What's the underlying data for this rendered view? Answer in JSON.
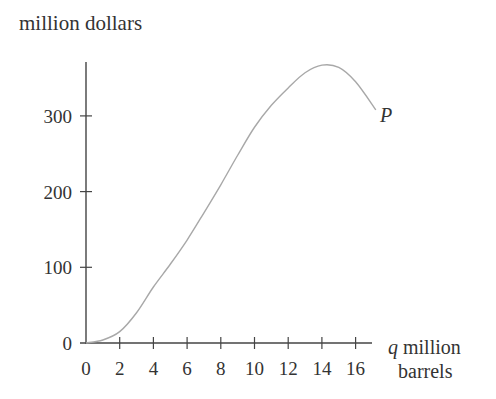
{
  "chart_data": {
    "type": "line",
    "title": "",
    "ylabel": "million dollars",
    "xlabel_var": "q",
    "xlabel": "million barrels",
    "curve_label": "P",
    "xlim": [
      0,
      17.5
    ],
    "ylim": [
      0,
      370
    ],
    "x_ticks": [
      0,
      2,
      4,
      6,
      8,
      10,
      12,
      14,
      16
    ],
    "y_ticks": [
      0,
      100,
      200,
      300
    ],
    "grid": false,
    "legend": null,
    "series": [
      {
        "name": "P",
        "color": "#a8a8a8",
        "x": [
          0,
          1,
          2,
          3,
          4,
          5,
          6,
          7,
          8,
          9,
          10,
          11,
          12,
          13,
          14,
          15,
          16,
          17.2
        ],
        "values": [
          0,
          4,
          15,
          40,
          74,
          104,
          136,
          172,
          209,
          248,
          285,
          314,
          337,
          357,
          367,
          364,
          345,
          308
        ]
      }
    ]
  },
  "axes": {
    "x_tick_labels": [
      "0",
      "2",
      "4",
      "6",
      "8",
      "10",
      "12",
      "14",
      "16"
    ],
    "y_tick_labels": [
      "0",
      "100",
      "200",
      "300"
    ]
  }
}
